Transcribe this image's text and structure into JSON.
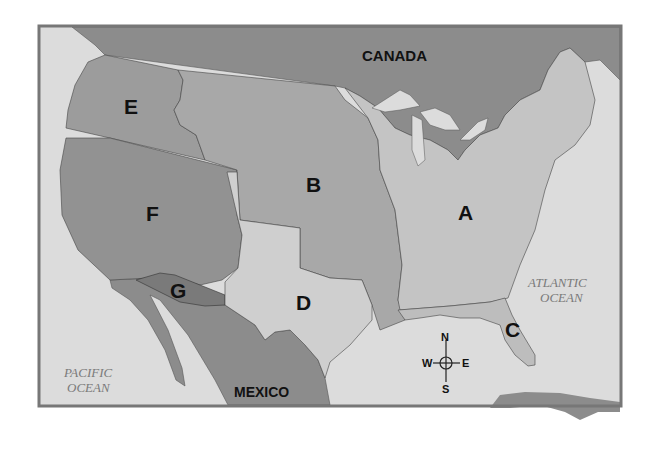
{
  "map": {
    "countries": {
      "canada": "CANADA",
      "mexico": "MEXICO"
    },
    "oceans": {
      "pacific_line1": "PACIFIC",
      "pacific_line2": "OCEAN",
      "atlantic_line1": "ATLANTIC",
      "atlantic_line2": "OCEAN"
    },
    "regions": {
      "A": "A",
      "B": "B",
      "C": "C",
      "D": "D",
      "E": "E",
      "F": "F",
      "G": "G"
    },
    "compass": {
      "n": "N",
      "s": "S",
      "e": "E",
      "w": "W"
    },
    "colors": {
      "water": "#dcdcdc",
      "foreign": "#8c8c8c",
      "region_a": "#c4c4c4",
      "region_b": "#a8a8a8",
      "region_c": "#bdbdbd",
      "region_d": "#cfcfcf",
      "region_e": "#9c9c9c",
      "region_f": "#929292",
      "region_g": "#7a7a7a",
      "frame": "#777777"
    }
  }
}
